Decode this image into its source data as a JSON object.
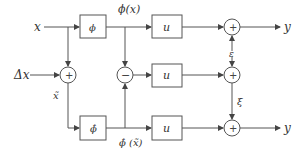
{
  "diagram": {
    "title": "",
    "inputs": {
      "x": "x",
      "delta_x": "Δx"
    },
    "outputs": {
      "y_top": "y",
      "y_bottom": "y"
    },
    "blocks": {
      "phi": "ϕ",
      "phi_hat": "ϕ̂",
      "u_top": "u",
      "u_middle": "u",
      "u_bottom": "u"
    },
    "signals": {
      "phi_x": "ϕ(x)",
      "phi_hat_xbar": "ϕ̂ (x̃)",
      "x_tilde": "x̃",
      "epsilon": "ε",
      "xi": "ξ"
    },
    "junctions": {
      "sum_input": "+",
      "diff": "−",
      "sum_top": "+",
      "sum_middle": "+",
      "sum_bottom": "+"
    },
    "colors": {
      "line": "#555555",
      "text": "#333333",
      "background": "#ffffff"
    }
  }
}
